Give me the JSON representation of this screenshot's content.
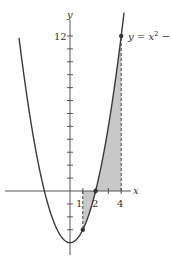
{
  "figure": {
    "function_label": "y = x² − 4",
    "function_label_parts": {
      "lhs": "y = x",
      "exp": "2",
      "rhs": " − 4"
    },
    "axis_x_label": "x",
    "axis_y_label": "y",
    "y_tick_label": "12",
    "x_tick_labels": [
      "1",
      "2",
      "4"
    ],
    "shaded_interval": [
      1,
      4
    ],
    "marked_points": [
      [
        1,
        -3
      ],
      [
        2,
        0
      ],
      [
        4,
        12
      ]
    ],
    "colors": {
      "curve": "#3a3a3a",
      "shade": "#c8c8c8",
      "axis": "#555555"
    }
  }
}
